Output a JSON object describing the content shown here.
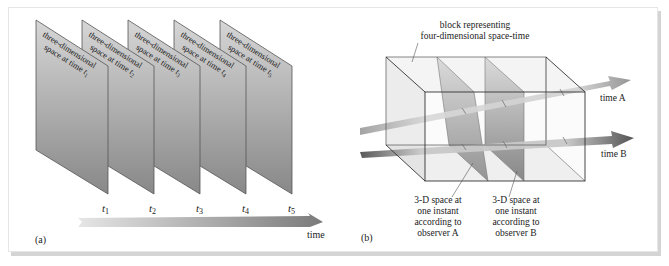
{
  "figure": {
    "panel_a": {
      "label": "(a)",
      "sheets": [
        {
          "line1": "three-dimensional",
          "line2": "space at time",
          "var": "t",
          "sub": "1"
        },
        {
          "line1": "three-dimensional",
          "line2": "space at time",
          "var": "t",
          "sub": "2"
        },
        {
          "line1": "three-dimensional",
          "line2": "space at time",
          "var": "t",
          "sub": "3"
        },
        {
          "line1": "three-dimensional",
          "line2": "space at time",
          "var": "t",
          "sub": "4"
        },
        {
          "line1": "three-dimensional",
          "line2": "space at time",
          "var": "t",
          "sub": "5"
        }
      ],
      "ticks": [
        {
          "var": "t",
          "sub": "1"
        },
        {
          "var": "t",
          "sub": "2"
        },
        {
          "var": "t",
          "sub": "3"
        },
        {
          "var": "t",
          "sub": "4"
        },
        {
          "var": "t",
          "sub": "5"
        }
      ],
      "axis_label": "time"
    },
    "panel_b": {
      "label": "(b)",
      "block_label_line1": "block representing",
      "block_label_line2": "four-dimensional space-time",
      "arrow_a_label": "time A",
      "arrow_b_label": "time B",
      "slice_a": {
        "line1": "3-D space at",
        "line2": "one instant",
        "line3": "according to",
        "line4": "observer A"
      },
      "slice_b": {
        "line1": "3-D space at",
        "line2": "one instant",
        "line3": "according to",
        "line4": "observer B"
      }
    },
    "colors": {
      "sheet_top": "#d0d0d0",
      "sheet_bottom": "#8c8c8c",
      "arrow_a": "#8a8a8a",
      "arrow_b": "#4a4a4a",
      "frame_shadow": "#d4d4d4"
    }
  }
}
